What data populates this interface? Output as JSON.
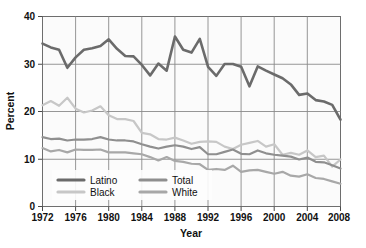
{
  "chart_data": {
    "type": "line",
    "title": "",
    "xlabel": "Year",
    "ylabel": "Percent",
    "xlim": [
      1972,
      2008
    ],
    "ylim": [
      0,
      40
    ],
    "yticks": [
      0,
      10,
      20,
      30,
      40
    ],
    "xticks": [
      1972,
      1976,
      1980,
      1984,
      1988,
      1992,
      1996,
      2000,
      2004,
      2008
    ],
    "grid": true,
    "legend_position": "lower-left-inside",
    "x": [
      1972,
      1973,
      1974,
      1975,
      1976,
      1977,
      1978,
      1979,
      1980,
      1981,
      1982,
      1983,
      1984,
      1985,
      1986,
      1987,
      1988,
      1989,
      1990,
      1991,
      1992,
      1993,
      1994,
      1995,
      1996,
      1997,
      1998,
      1999,
      2000,
      2001,
      2002,
      2003,
      2004,
      2005,
      2006,
      2007,
      2008
    ],
    "series": [
      {
        "name": "Latino",
        "color": "#6b6b6b",
        "values": [
          34.3,
          33.5,
          33.0,
          29.2,
          31.4,
          33.0,
          33.3,
          33.8,
          35.2,
          33.2,
          31.7,
          31.6,
          29.8,
          27.6,
          30.1,
          28.6,
          35.8,
          33.0,
          32.4,
          35.3,
          29.4,
          27.5,
          30.0,
          30.0,
          29.4,
          25.3,
          29.5,
          28.6,
          27.8,
          27.0,
          25.7,
          23.5,
          23.8,
          22.4,
          22.1,
          21.4,
          18.3
        ]
      },
      {
        "name": "Black",
        "color": "#c7c7c7",
        "values": [
          21.3,
          22.2,
          21.2,
          22.9,
          20.6,
          19.8,
          20.2,
          21.1,
          19.2,
          18.4,
          18.4,
          18.0,
          15.5,
          15.2,
          14.2,
          14.1,
          14.5,
          13.9,
          13.2,
          13.6,
          13.7,
          13.6,
          12.6,
          12.1,
          13.0,
          13.4,
          13.8,
          12.6,
          13.1,
          10.9,
          11.3,
          10.9,
          11.8,
          10.4,
          10.7,
          8.4,
          9.9
        ]
      },
      {
        "name": "Total",
        "color": "#8f8f8f",
        "values": [
          14.6,
          14.2,
          14.3,
          13.9,
          14.1,
          14.1,
          14.2,
          14.6,
          14.1,
          13.9,
          13.9,
          13.7,
          13.1,
          12.6,
          12.2,
          12.6,
          12.9,
          12.6,
          12.1,
          12.5,
          11.0,
          11.0,
          11.5,
          12.0,
          11.1,
          11.0,
          11.8,
          11.2,
          10.9,
          10.7,
          10.5,
          9.9,
          10.3,
          9.4,
          9.3,
          8.7,
          8.0
        ]
      },
      {
        "name": "White",
        "color": "#a8a8a8",
        "values": [
          12.3,
          11.6,
          11.9,
          11.4,
          12.0,
          11.9,
          11.9,
          12.0,
          11.4,
          11.4,
          11.4,
          11.2,
          11.0,
          10.4,
          9.7,
          10.4,
          9.6,
          9.4,
          9.0,
          8.9,
          7.7,
          7.9,
          7.7,
          8.6,
          7.3,
          7.6,
          7.7,
          7.3,
          6.9,
          7.3,
          6.5,
          6.3,
          6.8,
          6.0,
          5.8,
          5.3,
          4.8
        ]
      }
    ],
    "legend": [
      {
        "label": "Latino",
        "color": "#6b6b6b"
      },
      {
        "label": "Black",
        "color": "#c7c7c7"
      },
      {
        "label": "Total",
        "color": "#8f8f8f"
      },
      {
        "label": "White",
        "color": "#a8a8a8"
      }
    ]
  },
  "axes": {
    "ylabel": "Percent",
    "xlabel": "Year",
    "ytick_labels": [
      "0",
      "10",
      "20",
      "30",
      "40"
    ],
    "xtick_labels": [
      "1972",
      "1976",
      "1980",
      "1984",
      "1988",
      "1992",
      "1996",
      "2000",
      "2004",
      "2008"
    ]
  },
  "legend": {
    "latino": "Latino",
    "black": "Black",
    "total": "Total",
    "white": "White"
  }
}
